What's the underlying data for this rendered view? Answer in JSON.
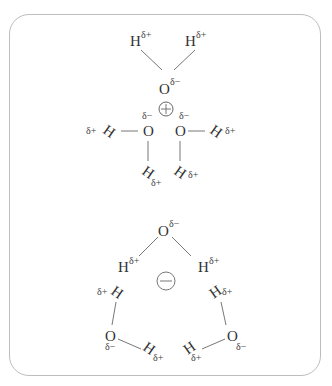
{
  "diagram": {
    "cation_cluster": {
      "ion_symbol": "+",
      "label": "cation surrounded by water oxygen atoms",
      "atoms": {
        "O": "O",
        "H": "H"
      },
      "charges": {
        "partial_positive": "δ+",
        "partial_negative": "δ−"
      }
    },
    "anion_cluster": {
      "ion_symbol": "−",
      "label": "anion surrounded by water hydrogen atoms",
      "atoms": {
        "O": "O",
        "H": "H"
      },
      "charges": {
        "partial_positive": "δ+",
        "partial_negative": "δ−"
      }
    },
    "colors": {
      "border": "#bdbdbd",
      "text": "#333333",
      "bond": "#777777"
    }
  }
}
